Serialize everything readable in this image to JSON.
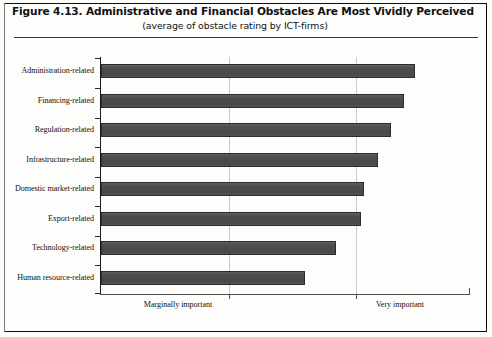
{
  "figure": {
    "title": "Figure 4.13.  Administrative and Financial Obstacles Are Most Vividly Perceived",
    "subtitle": "(average of obstacle rating by ICT-firms)"
  },
  "axis_notes": {
    "left_label": "Marginally important",
    "right_label": "Very important"
  },
  "colors": {
    "bar_fill": "#4d4d4d",
    "bar_stroke": "#2c2c2c",
    "axis": "#1b1b1b",
    "gridline": "#c9c9c9",
    "frame": "#0d0d0d",
    "text": "#111111"
  },
  "chart_data": {
    "type": "bar",
    "orientation": "horizontal",
    "title": "Figure 4.13.  Administrative and Financial Obstacles Are Most Vividly Perceived",
    "subtitle": "(average of obstacle rating by ICT-firms)",
    "xlabel": "",
    "ylabel": "",
    "xlim": [
      0,
      3
    ],
    "grid": true,
    "gridline_positions": [
      1.04,
      2.07
    ],
    "tick_labels": [
      "Marginally important",
      "Very important"
    ],
    "categories": [
      "Administration-related",
      "Financing-related",
      "Regulation-related",
      "Infrastructure-related",
      "Domestic market-related",
      "Export-related",
      "Technology-related",
      "Human resource-related"
    ],
    "values": [
      2.55,
      2.46,
      2.36,
      2.25,
      2.14,
      2.11,
      1.91,
      1.66
    ],
    "legend": []
  }
}
